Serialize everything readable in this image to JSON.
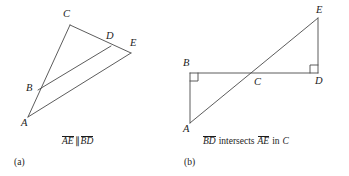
{
  "figure": {
    "background": "#ffffff",
    "stroke_color": "#4a4a4a",
    "panels": [
      {
        "id": "a",
        "sublabel": "(a)",
        "caption": {
          "segment1": "AE",
          "relation": "∥",
          "segment2": "BD",
          "full_text": "AE ∥ BD"
        },
        "points": [
          {
            "label": "A",
            "x": 28,
            "y": 117
          },
          {
            "label": "B",
            "x": 38,
            "y": 90
          },
          {
            "label": "C",
            "x": 70,
            "y": 25
          },
          {
            "label": "D",
            "x": 111,
            "y": 46
          },
          {
            "label": "E",
            "x": 131,
            "y": 53
          }
        ],
        "segments": [
          {
            "name": "A-to-C",
            "from": "A",
            "to": "C"
          },
          {
            "name": "C-to-E",
            "from": "C",
            "to": "E"
          },
          {
            "name": "A-to-E",
            "from": "A",
            "to": "E"
          },
          {
            "name": "B-to-D",
            "from": "B",
            "to": "D"
          }
        ]
      },
      {
        "id": "b",
        "sublabel": "(b)",
        "caption": {
          "segment1": "BD",
          "relation": "intersects",
          "segment2": "AE",
          "tail": "in",
          "point": "C",
          "full_text": "BD intersects AE in C"
        },
        "points": [
          {
            "label": "A",
            "x": 190,
            "y": 123
          },
          {
            "label": "B",
            "x": 190,
            "y": 73
          },
          {
            "label": "C",
            "x": 258,
            "y": 73
          },
          {
            "label": "D",
            "x": 318,
            "y": 73
          },
          {
            "label": "E",
            "x": 318,
            "y": 18
          }
        ],
        "segments": [
          {
            "name": "A-to-B",
            "from": "A",
            "to": "B"
          },
          {
            "name": "B-to-D",
            "from": "B",
            "to": "D"
          },
          {
            "name": "D-to-E",
            "from": "D",
            "to": "E"
          },
          {
            "name": "A-to-E",
            "from": "A",
            "to": "E"
          }
        ],
        "right_angles": [
          {
            "at": "B",
            "name": "right-angle-at-B"
          },
          {
            "at": "D",
            "name": "right-angle-at-D"
          }
        ]
      }
    ]
  }
}
